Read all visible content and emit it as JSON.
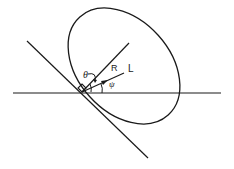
{
  "diagram": {
    "type": "geometry",
    "stroke_color": "#1a1a1a",
    "background": "#ffffff",
    "labels": {
      "theta": "θ",
      "R": "R",
      "L": "L",
      "psi": "ψ"
    },
    "elements": {
      "horizontal_axis": {
        "x1": 13,
        "y1": 93,
        "x2": 221,
        "y2": 93
      },
      "tangent_line": {
        "x1": 27,
        "y1": 41,
        "x2": 148,
        "y2": 158
      },
      "normal_line": {
        "x1": 82,
        "y1": 92,
        "x2": 129,
        "y2": 43
      },
      "ray_L": {
        "x1": 82,
        "y1": 92,
        "x2": 124,
        "y2": 73
      },
      "ellipse": {
        "cx": 124,
        "cy": 66,
        "rx": 66,
        "ry": 47,
        "rotate": 48
      },
      "vertex": {
        "x": 82,
        "y": 92
      }
    }
  }
}
